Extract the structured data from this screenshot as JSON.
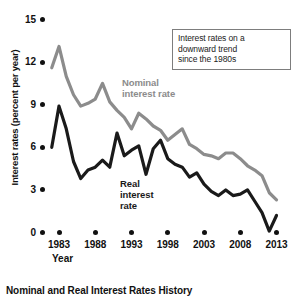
{
  "caption": "Nominal and Real Interest Rates History",
  "annotation": {
    "line1": "Interest rates on a",
    "line2": "downward trend",
    "line3": "since the 1980s"
  },
  "labels": {
    "nominal_line1": "Nominal",
    "nominal_line2": "interest rate",
    "real_line1": "Real",
    "real_line2": "interest",
    "real_line3": "rate"
  },
  "colors": {
    "nominal": "#8c8c8c",
    "real": "#1a1a1a",
    "axis": "#111111",
    "annotation_border": "#7d7d7d",
    "background": "#ffffff"
  },
  "chart_data": {
    "type": "line",
    "title": "Nominal and Real Interest Rates History",
    "xlabel": "Year",
    "ylabel": "Interest rates (percent per year)",
    "xlim": [
      1982,
      2013
    ],
    "ylim": [
      0,
      15
    ],
    "yticks": [
      0,
      3,
      6,
      9,
      12,
      15
    ],
    "ytick_labels": [
      "0",
      "3",
      "6",
      "9",
      "12",
      "15"
    ],
    "xticks": [
      1983,
      1988,
      1993,
      1998,
      2003,
      2008,
      2013
    ],
    "xtick_labels": [
      "1983",
      "1988",
      "1993",
      "1998",
      "2003",
      "2008",
      "2013"
    ],
    "grid": false,
    "legend": "inline-annotations",
    "annotations": [
      {
        "text": "Interest rates on a downward trend since the 1980s",
        "position": "top-right",
        "boxed": true
      },
      {
        "text": "Nominal interest rate",
        "position": "center-upper"
      },
      {
        "text": "Real interest rate",
        "position": "center-lower"
      }
    ],
    "x": [
      1982,
      1983,
      1984,
      1985,
      1986,
      1987,
      1988,
      1989,
      1990,
      1991,
      1992,
      1993,
      1994,
      1995,
      1996,
      1997,
      1998,
      1999,
      2000,
      2001,
      2002,
      2003,
      2004,
      2005,
      2006,
      2007,
      2008,
      2009,
      2010,
      2011,
      2012,
      2013
    ],
    "series": [
      {
        "name": "Nominal interest rate",
        "color": "#8c8c8c",
        "values": [
          11.6,
          13.1,
          11.0,
          9.7,
          8.9,
          9.1,
          9.4,
          10.5,
          9.2,
          8.6,
          8.1,
          7.3,
          8.4,
          8.0,
          7.5,
          7.2,
          6.5,
          6.9,
          7.3,
          6.2,
          5.9,
          5.5,
          5.4,
          5.2,
          5.6,
          5.6,
          5.2,
          4.7,
          4.4,
          4.0,
          2.8,
          2.3
        ]
      },
      {
        "name": "Real interest rate",
        "color": "#1a1a1a",
        "values": [
          6.0,
          8.9,
          7.3,
          5.0,
          3.8,
          4.4,
          4.6,
          5.1,
          4.6,
          7.0,
          5.4,
          5.8,
          6.1,
          4.1,
          5.9,
          6.5,
          5.2,
          4.8,
          4.6,
          3.9,
          4.2,
          3.4,
          2.9,
          2.6,
          3.0,
          2.6,
          2.7,
          3.0,
          2.2,
          1.4,
          0.1,
          1.2
        ]
      }
    ]
  }
}
